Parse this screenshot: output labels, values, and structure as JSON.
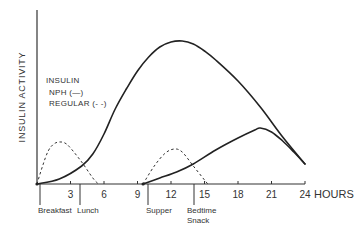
{
  "chart_data": {
    "type": "line",
    "title": "",
    "xlabel": "HOURS",
    "ylabel": "INSULIN ACTIVITY",
    "xlim": [
      0,
      24
    ],
    "ylim": [
      0,
      150
    ],
    "grid": false,
    "x_ticks": [
      3,
      6,
      9,
      12,
      15,
      18,
      21,
      24
    ],
    "y_ticks": [],
    "legend": {
      "title": "INSULIN",
      "entries": [
        {
          "label": "NPH (—)",
          "series": "NPH",
          "style": "solid"
        },
        {
          "label": "REGULAR (- -)",
          "series": "REGULAR",
          "style": "dashed"
        }
      ],
      "position": "upper-left"
    },
    "series": [
      {
        "name": "NPH (morning dose)",
        "style": "solid",
        "points": [
          [
            0,
            0
          ],
          [
            2,
            5
          ],
          [
            4,
            18
          ],
          [
            5,
            30
          ],
          [
            6,
            50
          ],
          [
            7,
            75
          ],
          [
            8,
            95
          ],
          [
            9,
            113
          ],
          [
            10,
            127
          ],
          [
            11,
            137
          ],
          [
            12,
            142
          ],
          [
            13,
            143
          ],
          [
            14,
            140
          ],
          [
            15,
            133
          ],
          [
            16,
            124
          ],
          [
            18,
            103
          ],
          [
            20,
            77
          ],
          [
            22,
            47
          ],
          [
            24,
            20
          ]
        ]
      },
      {
        "name": "NPH (evening dose)",
        "style": "solid",
        "points": [
          [
            9.5,
            0
          ],
          [
            11,
            6
          ],
          [
            12.5,
            12
          ],
          [
            14,
            20
          ],
          [
            16,
            34
          ],
          [
            18,
            46
          ],
          [
            19.5,
            54
          ],
          [
            20,
            56
          ],
          [
            21,
            52
          ],
          [
            22,
            43
          ],
          [
            23,
            32
          ],
          [
            24,
            20
          ]
        ]
      },
      {
        "name": "REGULAR (morning dose)",
        "style": "dashed",
        "points": [
          [
            0,
            0
          ],
          [
            0.5,
            18
          ],
          [
            1,
            33
          ],
          [
            1.5,
            40
          ],
          [
            2,
            42
          ],
          [
            2.5,
            41
          ],
          [
            3,
            36
          ],
          [
            4,
            22
          ],
          [
            5,
            6
          ],
          [
            5.5,
            0
          ]
        ]
      },
      {
        "name": "REGULAR (evening dose)",
        "style": "dashed",
        "points": [
          [
            9.5,
            0
          ],
          [
            10.5,
            18
          ],
          [
            11.5,
            31
          ],
          [
            12.3,
            35
          ],
          [
            13,
            32
          ],
          [
            14,
            18
          ],
          [
            15,
            4
          ],
          [
            15.3,
            0
          ]
        ]
      }
    ],
    "annotations": [
      {
        "text": "Breakfast",
        "x": 0.3
      },
      {
        "text": "Lunch",
        "x": 3.9
      },
      {
        "text": "Supper",
        "x": 9.9
      },
      {
        "text": "Bedtime Snack",
        "x": 14.1
      }
    ]
  },
  "labels": {
    "y_axis": "INSULIN ACTIVITY",
    "x_unit": "HOURS",
    "ticks": [
      "3",
      "6",
      "9",
      "12",
      "15",
      "18",
      "21",
      "24"
    ],
    "legend_title": "INSULIN",
    "legend_nph": "NPH (—)",
    "legend_regular": "REGULAR (- -)",
    "meals": {
      "breakfast": "Breakfast",
      "lunch": "Lunch",
      "supper": "Supper",
      "bedtime_1": "Bedtime",
      "bedtime_2": "Snack"
    }
  }
}
